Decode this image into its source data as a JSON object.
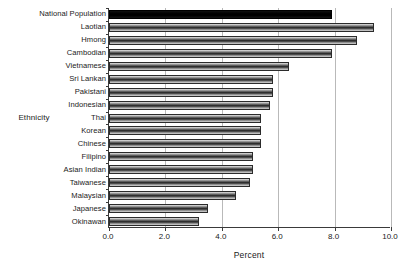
{
  "chart_data": {
    "type": "bar",
    "orientation": "horizontal",
    "title": "",
    "xlabel": "Percent",
    "ylabel": "Ethnicity",
    "xlim": [
      0.0,
      10.0
    ],
    "xticks": [
      "0.0",
      "2.0",
      "4.0",
      "6.0",
      "8.0",
      "10.0"
    ],
    "xtick_values": [
      0.0,
      2.0,
      4.0,
      6.0,
      8.0,
      10.0
    ],
    "grid": "vertical",
    "legend": "none",
    "categories": [
      "National Population",
      "Laotian",
      "Hmong",
      "Cambodian",
      "Vietnamese",
      "Sri Lankan",
      "Pakistani",
      "Indonesian",
      "Thai",
      "Korean",
      "Chinese",
      "Filipino",
      "Asian Indian",
      "Taiwanese",
      "Malaysian",
      "Japanese",
      "Okinawan"
    ],
    "values": [
      7.9,
      9.4,
      8.8,
      7.9,
      6.4,
      5.8,
      5.8,
      5.7,
      5.4,
      5.4,
      5.4,
      5.1,
      5.1,
      5.0,
      4.5,
      3.5,
      3.2
    ],
    "highlight_index": 0,
    "colors": {
      "bar_fill": "#2e2e2e",
      "bar_edge": "#2b2b2b",
      "highlight_fill": "#000000",
      "gridline": "#b9b9b9",
      "axis": "#3a3a3a",
      "background": "#ffffff",
      "text": "#1a1a1a"
    }
  }
}
